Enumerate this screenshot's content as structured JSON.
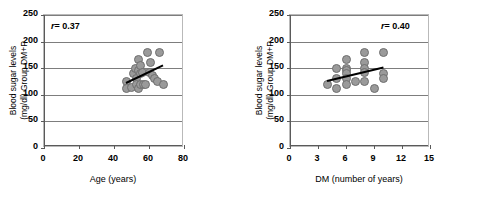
{
  "figure": {
    "panels": [
      {
        "id": "panel-age",
        "r_label_prefix": "r",
        "r_label_value": "= 0.37",
        "r_position": "top-left",
        "ylabel_line1": "Blood sugar levels",
        "ylabel_line2": "(mg/dl) Group DM+P",
        "xlabel": "Age (years)",
        "yticks": [
          "250",
          "200",
          "150",
          "100",
          "50",
          "0"
        ],
        "xticks": [
          "0",
          "20",
          "40",
          "60",
          "80"
        ]
      },
      {
        "id": "panel-dm",
        "r_label_prefix": "r",
        "r_label_value": "= 0.40",
        "r_position": "top-right",
        "ylabel_line1": "Blood sugar levels",
        "ylabel_line2": "(mg/dl) Group DM+P",
        "xlabel": "DM (number of years)",
        "yticks": [
          "250",
          "200",
          "150",
          "100",
          "50",
          "0"
        ],
        "xticks": [
          "0",
          "3",
          "6",
          "9",
          "12",
          "15"
        ]
      }
    ],
    "colors": {
      "marker_fill": "#9a9a9a",
      "marker_stroke": "#6f6f6f",
      "trendline": "#000000",
      "gridline": "#7d7d7d",
      "axis": "#5a5a5a",
      "background": "#ffffff"
    }
  },
  "chart_data": [
    {
      "type": "scatter",
      "id": "panel-age",
      "title": "",
      "xlabel": "Age (years)",
      "ylabel": "Blood sugar levels (mg/dl) Group DM+P",
      "xlim": [
        0,
        80
      ],
      "ylim": [
        0,
        250
      ],
      "xticks": [
        0,
        20,
        40,
        60,
        80
      ],
      "yticks": [
        0,
        50,
        100,
        150,
        200,
        250
      ],
      "grid": "horizontal",
      "legend": "none",
      "annotations": [
        {
          "text": "r = 0.37",
          "x": 8,
          "y": 228
        }
      ],
      "correlation_r": 0.37,
      "points": [
        {
          "x": 47,
          "y": 125
        },
        {
          "x": 47,
          "y": 112
        },
        {
          "x": 50,
          "y": 113
        },
        {
          "x": 51,
          "y": 140
        },
        {
          "x": 52,
          "y": 150
        },
        {
          "x": 53,
          "y": 130
        },
        {
          "x": 53,
          "y": 120
        },
        {
          "x": 54,
          "y": 166
        },
        {
          "x": 54,
          "y": 145
        },
        {
          "x": 54,
          "y": 111
        },
        {
          "x": 55,
          "y": 155
        },
        {
          "x": 55,
          "y": 140
        },
        {
          "x": 55,
          "y": 120
        },
        {
          "x": 56,
          "y": 142
        },
        {
          "x": 57,
          "y": 120
        },
        {
          "x": 58,
          "y": 119
        },
        {
          "x": 59,
          "y": 180
        },
        {
          "x": 60,
          "y": 141
        },
        {
          "x": 61,
          "y": 160
        },
        {
          "x": 62,
          "y": 136
        },
        {
          "x": 63,
          "y": 131
        },
        {
          "x": 65,
          "y": 125
        },
        {
          "x": 66,
          "y": 180
        },
        {
          "x": 68,
          "y": 120
        }
      ],
      "trendline": {
        "x1": 47,
        "y1": 125,
        "x2": 68,
        "y2": 158
      }
    },
    {
      "type": "scatter",
      "id": "panel-dm",
      "title": "",
      "xlabel": "DM (number of years)",
      "ylabel": "Blood sugar levels (mg/dl) Group DM+P",
      "xlim": [
        0,
        15
      ],
      "ylim": [
        0,
        250
      ],
      "xticks": [
        0,
        3,
        6,
        9,
        12,
        15
      ],
      "yticks": [
        0,
        50,
        100,
        150,
        200,
        250
      ],
      "grid": "horizontal",
      "legend": "none",
      "annotations": [
        {
          "text": "r = 0.40",
          "x": 13,
          "y": 228
        }
      ],
      "correlation_r": 0.4,
      "points": [
        {
          "x": 4,
          "y": 120
        },
        {
          "x": 5,
          "y": 150
        },
        {
          "x": 5,
          "y": 130
        },
        {
          "x": 5,
          "y": 111
        },
        {
          "x": 6,
          "y": 166
        },
        {
          "x": 6,
          "y": 150
        },
        {
          "x": 6,
          "y": 145
        },
        {
          "x": 6,
          "y": 140
        },
        {
          "x": 6,
          "y": 131
        },
        {
          "x": 6,
          "y": 120
        },
        {
          "x": 7,
          "y": 125
        },
        {
          "x": 8,
          "y": 180
        },
        {
          "x": 8,
          "y": 160
        },
        {
          "x": 8,
          "y": 150
        },
        {
          "x": 8,
          "y": 142
        },
        {
          "x": 8,
          "y": 125
        },
        {
          "x": 9,
          "y": 111
        },
        {
          "x": 10,
          "y": 180
        },
        {
          "x": 10,
          "y": 140
        },
        {
          "x": 10,
          "y": 131
        }
      ],
      "trendline": {
        "x1": 4,
        "y1": 127,
        "x2": 10,
        "y2": 152
      }
    }
  ]
}
